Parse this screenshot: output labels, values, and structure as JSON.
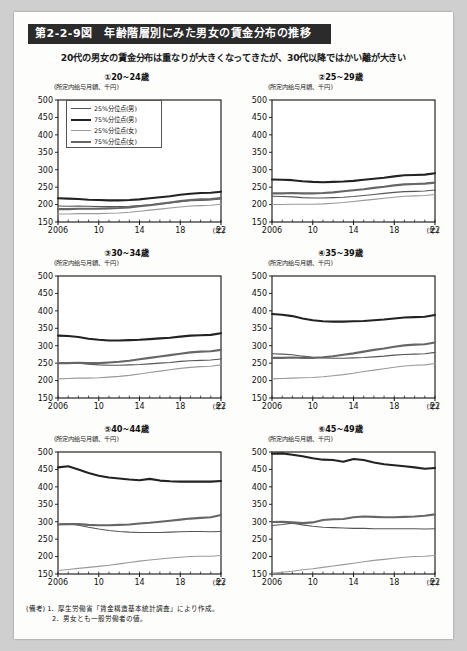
{
  "header": {
    "figure_title": "第2-2-9図　年齢階層別にみた男女の賃金分布の推移",
    "subtitle": "20代の男女の賃金分布は重なりが大きくなってきたが、30代以降ではかい離が大きい"
  },
  "legend": {
    "items": [
      {
        "label": "25%分位点(男)",
        "color": "#555555",
        "width": 1.1
      },
      {
        "label": "75%分位点(男)",
        "color": "#222222",
        "width": 2.1
      },
      {
        "label": "25%分位点(女)",
        "color": "#999999",
        "width": 1.1
      },
      {
        "label": "75%分位点(女)",
        "color": "#666666",
        "width": 2.1
      }
    ]
  },
  "axis": {
    "unit_label": "(所定内給与月額、千円)",
    "x_unit": "(年)",
    "y_ticks": [
      150,
      200,
      250,
      300,
      350,
      400,
      450,
      500
    ],
    "x_ticks": [
      "2006",
      "10",
      "14",
      "18",
      "22"
    ]
  },
  "notes": [
    "(備考) 1．厚生労働省「賃金構造基本統計調査」により作成。",
    "2．男女とも一般労働者の値。"
  ],
  "chart_data": [
    {
      "type": "line",
      "panel": "①20~24歳",
      "title": "①20~24歳",
      "xlabel": "(年)",
      "ylabel": "(所定内給与月額、千円)",
      "xlim": [
        2006,
        2022
      ],
      "ylim": [
        150,
        500
      ],
      "grid": false,
      "x": [
        2006,
        2007,
        2008,
        2009,
        2010,
        2011,
        2012,
        2013,
        2014,
        2015,
        2016,
        2017,
        2018,
        2019,
        2020,
        2021,
        2022
      ],
      "series": [
        {
          "name": "25%分位点(男)",
          "values": [
            196,
            195,
            196,
            195,
            194,
            194,
            194,
            195,
            197,
            199,
            202,
            205,
            208,
            211,
            212,
            213,
            216
          ]
        },
        {
          "name": "75%分位点(男)",
          "values": [
            218,
            217,
            216,
            214,
            213,
            212,
            212,
            213,
            215,
            218,
            221,
            224,
            228,
            231,
            233,
            234,
            237
          ]
        },
        {
          "name": "25%分位点(女)",
          "values": [
            173,
            173,
            174,
            174,
            174,
            175,
            176,
            178,
            181,
            184,
            187,
            190,
            193,
            196,
            197,
            198,
            201
          ]
        },
        {
          "name": "75%分位点(女)",
          "values": [
            187,
            187,
            188,
            188,
            188,
            189,
            190,
            192,
            195,
            198,
            202,
            206,
            210,
            213,
            215,
            216,
            219
          ]
        }
      ]
    },
    {
      "type": "line",
      "panel": "②25~29歳",
      "title": "②25~29歳",
      "xlabel": "(年)",
      "ylabel": "(所定内給与月額、千円)",
      "xlim": [
        2006,
        2022
      ],
      "ylim": [
        150,
        500
      ],
      "grid": false,
      "x": [
        2006,
        2007,
        2008,
        2009,
        2010,
        2011,
        2012,
        2013,
        2014,
        2015,
        2016,
        2017,
        2018,
        2019,
        2020,
        2021,
        2022
      ],
      "series": [
        {
          "name": "25%分位点(男)",
          "values": [
            224,
            223,
            222,
            220,
            219,
            219,
            220,
            221,
            223,
            226,
            229,
            232,
            235,
            237,
            238,
            239,
            242
          ]
        },
        {
          "name": "75%分位点(男)",
          "values": [
            272,
            271,
            270,
            267,
            265,
            264,
            265,
            266,
            268,
            271,
            274,
            277,
            281,
            284,
            285,
            286,
            290
          ]
        },
        {
          "name": "25%分位点(女)",
          "values": [
            200,
            200,
            201,
            201,
            201,
            202,
            204,
            206,
            209,
            212,
            215,
            218,
            221,
            224,
            225,
            226,
            229
          ]
        },
        {
          "name": "75%分位点(女)",
          "values": [
            232,
            232,
            233,
            232,
            232,
            233,
            235,
            238,
            241,
            244,
            248,
            251,
            255,
            258,
            259,
            260,
            263
          ]
        }
      ]
    },
    {
      "type": "line",
      "panel": "③30~34歳",
      "title": "③30~34歳",
      "xlabel": "(年)",
      "ylabel": "(所定内給与月額、千円)",
      "xlim": [
        2006,
        2022
      ],
      "ylim": [
        150,
        500
      ],
      "grid": false,
      "x": [
        2006,
        2007,
        2008,
        2009,
        2010,
        2011,
        2012,
        2013,
        2014,
        2015,
        2016,
        2017,
        2018,
        2019,
        2020,
        2021,
        2022
      ],
      "series": [
        {
          "name": "25%分位点(男)",
          "values": [
            252,
            251,
            250,
            247,
            245,
            244,
            244,
            245,
            246,
            248,
            250,
            252,
            255,
            257,
            258,
            259,
            262
          ]
        },
        {
          "name": "75%分位点(男)",
          "values": [
            329,
            328,
            325,
            320,
            317,
            315,
            315,
            316,
            317,
            319,
            321,
            323,
            326,
            329,
            330,
            331,
            336
          ]
        },
        {
          "name": "25%分位点(女)",
          "values": [
            205,
            206,
            207,
            207,
            208,
            210,
            212,
            215,
            219,
            223,
            227,
            231,
            235,
            238,
            240,
            241,
            245
          ]
        },
        {
          "name": "75%分位点(女)",
          "values": [
            250,
            250,
            251,
            250,
            250,
            252,
            254,
            257,
            261,
            265,
            269,
            273,
            277,
            281,
            283,
            284,
            288
          ]
        }
      ]
    },
    {
      "type": "line",
      "panel": "④35~39歳",
      "title": "④35~39歳",
      "xlabel": "(年)",
      "ylabel": "(所定内給与月額、千円)",
      "xlim": [
        2006,
        2022
      ],
      "ylim": [
        150,
        500
      ],
      "grid": false,
      "x": [
        2006,
        2007,
        2008,
        2009,
        2010,
        2011,
        2012,
        2013,
        2014,
        2015,
        2016,
        2017,
        2018,
        2019,
        2020,
        2021,
        2022
      ],
      "series": [
        {
          "name": "25%分位点(男)",
          "values": [
            277,
            276,
            274,
            270,
            267,
            265,
            264,
            264,
            265,
            266,
            268,
            270,
            273,
            275,
            276,
            277,
            281
          ]
        },
        {
          "name": "75%分位点(男)",
          "values": [
            391,
            389,
            385,
            378,
            373,
            370,
            369,
            369,
            370,
            371,
            373,
            375,
            378,
            381,
            382,
            383,
            388
          ]
        },
        {
          "name": "25%分位点(女)",
          "values": [
            205,
            206,
            207,
            208,
            209,
            211,
            214,
            217,
            221,
            226,
            230,
            234,
            238,
            242,
            244,
            245,
            249
          ]
        },
        {
          "name": "75%分位点(女)",
          "values": [
            265,
            265,
            266,
            265,
            265,
            267,
            270,
            274,
            278,
            283,
            288,
            292,
            297,
            301,
            303,
            304,
            309
          ]
        }
      ]
    },
    {
      "type": "line",
      "panel": "⑤40~44歳",
      "title": "⑤40~44歳",
      "xlabel": "(年)",
      "ylabel": "(所定内給与月額、千円)",
      "xlim": [
        2006,
        2022
      ],
      "ylim": [
        150,
        500
      ],
      "grid": false,
      "x": [
        2006,
        2007,
        2008,
        2009,
        2010,
        2011,
        2012,
        2013,
        2014,
        2015,
        2016,
        2017,
        2018,
        2019,
        2020,
        2021,
        2022
      ],
      "series": [
        {
          "name": "25%分位点(男)",
          "values": [
            293,
            295,
            290,
            284,
            279,
            275,
            272,
            270,
            269,
            269,
            269,
            270,
            271,
            272,
            272,
            271,
            272
          ]
        },
        {
          "name": "75%分位点(男)",
          "values": [
            456,
            459,
            450,
            440,
            432,
            427,
            424,
            421,
            419,
            423,
            418,
            416,
            415,
            415,
            415,
            415,
            417
          ]
        },
        {
          "name": "25%分位点(女)",
          "values": [
            160,
            163,
            166,
            169,
            172,
            175,
            179,
            183,
            187,
            190,
            193,
            196,
            198,
            200,
            201,
            201,
            203
          ]
        },
        {
          "name": "75%分位点(女)",
          "values": [
            292,
            293,
            293,
            291,
            290,
            290,
            291,
            292,
            295,
            297,
            300,
            303,
            306,
            309,
            311,
            313,
            319
          ]
        }
      ]
    },
    {
      "type": "line",
      "panel": "⑥45~49歳",
      "title": "⑥45~49歳",
      "xlabel": "(年)",
      "ylabel": "(所定内給与月額、千円)",
      "xlim": [
        2006,
        2022
      ],
      "ylim": [
        150,
        500
      ],
      "grid": false,
      "x": [
        2006,
        2007,
        2008,
        2009,
        2010,
        2011,
        2012,
        2013,
        2014,
        2015,
        2016,
        2017,
        2018,
        2019,
        2020,
        2021,
        2022
      ],
      "series": [
        {
          "name": "25%分位点(男)",
          "values": [
            289,
            292,
            296,
            291,
            287,
            284,
            283,
            282,
            281,
            281,
            280,
            280,
            280,
            280,
            280,
            279,
            280
          ]
        },
        {
          "name": "75%分位点(男)",
          "values": [
            495,
            496,
            492,
            488,
            482,
            478,
            477,
            472,
            480,
            477,
            470,
            465,
            462,
            459,
            456,
            452,
            454
          ]
        },
        {
          "name": "25%分位点(女)",
          "values": [
            152,
            155,
            158,
            162,
            165,
            169,
            173,
            177,
            181,
            185,
            189,
            192,
            195,
            198,
            200,
            201,
            203
          ]
        },
        {
          "name": "75%分位点(女)",
          "values": [
            299,
            300,
            298,
            296,
            298,
            305,
            307,
            308,
            313,
            315,
            314,
            313,
            313,
            314,
            315,
            317,
            321
          ]
        }
      ]
    }
  ]
}
